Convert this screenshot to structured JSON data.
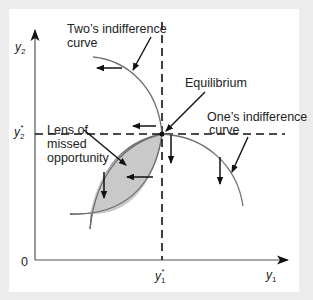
{
  "diagram": {
    "axes": {
      "x_label": "y",
      "x_label_sub": "1",
      "y_label": "y",
      "y_label_sub": "2",
      "origin_label": "0",
      "x_star_label": "y",
      "x_star_sub": "1",
      "x_star_sup": "*",
      "y_star_label": "y",
      "y_star_sub": "2",
      "y_star_sup": "*"
    },
    "labels": {
      "twos_curve_line1": "Two’s indifference",
      "twos_curve_line2": "curve",
      "equilibrium": "Equilibrium",
      "ones_curve_line1": "One’s indifference",
      "ones_curve_line2": "curve",
      "lens_line1": "Lens of",
      "lens_line2": "missed",
      "lens_line3": "opportunity"
    },
    "colors": {
      "background": "#ececec",
      "panel": "#ffffff",
      "curve": "#6e6e6e",
      "lens_fill": "#c9c9c9",
      "ink": "#111111"
    }
  }
}
